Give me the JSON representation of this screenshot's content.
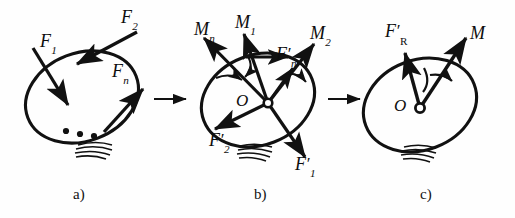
{
  "figure": {
    "background_color": "#fefefe",
    "ink_color": "#111111",
    "panel_count": 3
  },
  "panels": [
    {
      "id": "a",
      "caption": "a)",
      "description": "Rigid body with an arbitrary plane system of forces applied at different points",
      "body_shape": "ellipse",
      "center_marker": null,
      "center_label": null,
      "ellipsis_dots": 3,
      "hatching_lines": 4,
      "vectors": [
        {
          "name": "F1",
          "label_base": "F",
          "label_sub": "1",
          "label_prime": "",
          "type": "force"
        },
        {
          "name": "F2",
          "label_base": "F",
          "label_sub": "2",
          "label_prime": "",
          "type": "force"
        },
        {
          "name": "Fn",
          "label_base": "F",
          "label_sub": "n",
          "label_prime": "",
          "type": "force"
        }
      ]
    },
    {
      "id": "b",
      "caption": "b)",
      "description": "Forces translated to centre O with accompanying couple moments",
      "body_shape": "ellipse",
      "center_marker": "open-circle",
      "center_label": "O",
      "ellipsis_dots": 0,
      "hatching_lines": 4,
      "vectors": [
        {
          "name": "Mn",
          "label_base": "M",
          "label_sub": "n",
          "label_prime": "",
          "type": "moment"
        },
        {
          "name": "M1",
          "label_base": "M",
          "label_sub": "1",
          "label_prime": "",
          "type": "moment"
        },
        {
          "name": "M2",
          "label_base": "M",
          "label_sub": "2",
          "label_prime": "",
          "type": "moment"
        },
        {
          "name": "Fn-prime",
          "label_base": "F",
          "label_sub": "n",
          "label_prime": "′",
          "type": "force"
        },
        {
          "name": "F1-prime",
          "label_base": "F",
          "label_sub": "1",
          "label_prime": "′",
          "type": "force"
        },
        {
          "name": "F2-prime",
          "label_base": "F",
          "label_sub": "2",
          "label_prime": "′",
          "type": "force"
        }
      ]
    },
    {
      "id": "c",
      "caption": "c)",
      "description": "Resultant force at O and resultant couple moment",
      "body_shape": "ellipse",
      "center_marker": "open-circle",
      "center_label": "O",
      "ellipsis_dots": 0,
      "hatching_lines": 4,
      "vectors": [
        {
          "name": "FR-prime",
          "label_base": "F",
          "label_sub": "R",
          "label_prime": "′",
          "type": "force"
        },
        {
          "name": "M",
          "label_base": "M",
          "label_sub": "",
          "label_prime": "",
          "type": "moment"
        }
      ],
      "rotation_arrow": "clockwise-arc"
    }
  ],
  "transitions": [
    {
      "name": "arrow-a-to-b",
      "glyph": "→"
    },
    {
      "name": "arrow-b-to-c",
      "glyph": "→"
    }
  ],
  "labels": {
    "panel_a": {
      "F1": "F",
      "F1_sub": "1",
      "F2": "F",
      "F2_sub": "2",
      "Fn": "F",
      "Fn_sub": "n",
      "caption": "a)"
    },
    "panel_b": {
      "Mn": "M",
      "Mn_sub": "n",
      "M1": "M",
      "M1_sub": "1",
      "M2": "M",
      "M2_sub": "2",
      "Fnp": "F",
      "Fnp_sub": "n",
      "Fnp_prime": "′",
      "F1p": "F",
      "F1p_sub": "1",
      "F1p_prime": "′",
      "F2p": "F",
      "F2p_sub": "2",
      "F2p_prime": "′",
      "O": "O",
      "caption": "b)"
    },
    "panel_c": {
      "FRp": "F",
      "FRp_sub": "R",
      "FRp_prime": "′",
      "M": "M",
      "O": "O",
      "caption": "c)"
    }
  }
}
